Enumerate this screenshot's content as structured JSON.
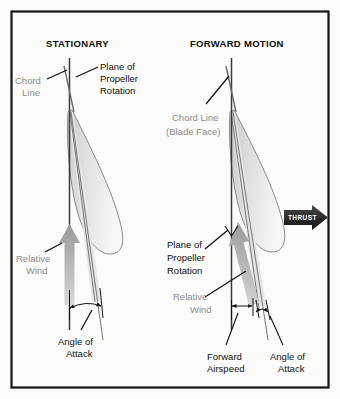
{
  "figure": {
    "background_color": "#fbfbfa",
    "frame_color": "#151515",
    "label_gray": "#8d8d8d",
    "label_black": "#101010",
    "blade_fill_color": "#d8d8d8",
    "arrow_gray": "#a8a8a8",
    "thrust_color": "#3a3a3a"
  },
  "panels": {
    "left": {
      "title": "STATIONARY",
      "labels": {
        "chord_line": "Chord\nLine",
        "chord_line_l1": "Chord",
        "chord_line_l2": "Line",
        "plane_of_rotation_l1": "Plane of",
        "plane_of_rotation_l2": "Propeller",
        "plane_of_rotation_l3": "Rotation",
        "relative_wind_l1": "Relative",
        "relative_wind_l2": "Wind",
        "angle_of_attack_l1": "Angle of",
        "angle_of_attack_l2": "Attack"
      }
    },
    "right": {
      "title": "FORWARD MOTION",
      "labels": {
        "chord_line_l1": "Chord Line",
        "chord_line_l2": "(Blade Face)",
        "plane_of_rotation_l1": "Plane of",
        "plane_of_rotation_l2": "Propeller",
        "plane_of_rotation_l3": "Rotation",
        "relative_wind_l1": "Relative",
        "relative_wind_l2": "Wind",
        "forward_airspeed_l1": "Forward",
        "forward_airspeed_l2": "Airspeed",
        "angle_of_attack_l1": "Angle of",
        "angle_of_attack_l2": "Attack",
        "thrust": "THRUST"
      }
    }
  }
}
